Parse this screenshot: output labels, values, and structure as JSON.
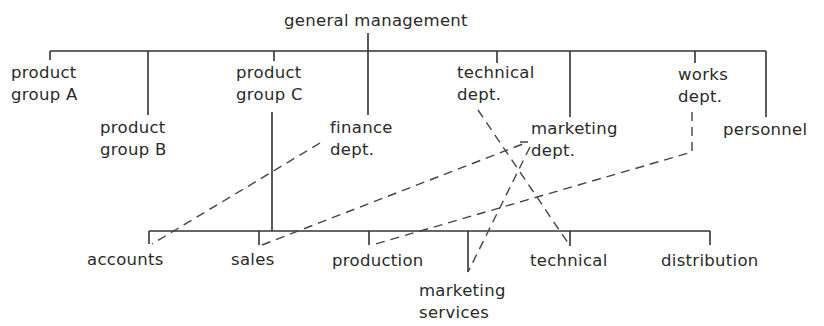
{
  "diagram": {
    "type": "organization-chart",
    "root": {
      "label": "general management"
    },
    "top_level_units": [
      {
        "id": "pgA",
        "lines": [
          "product",
          "group A"
        ]
      },
      {
        "id": "pgB",
        "lines": [
          "product",
          "group B"
        ]
      },
      {
        "id": "pgC",
        "lines": [
          "product",
          "group C"
        ]
      },
      {
        "id": "fin",
        "lines": [
          "finance",
          "dept."
        ]
      },
      {
        "id": "tech",
        "lines": [
          "technical",
          "dept."
        ]
      },
      {
        "id": "mkt",
        "lines": [
          "marketing",
          "dept."
        ]
      },
      {
        "id": "works",
        "lines": [
          "works",
          "dept."
        ]
      },
      {
        "id": "pers",
        "lines": [
          "personnel"
        ]
      }
    ],
    "sub_units_of_product_group_C": [
      {
        "id": "acc",
        "lines": [
          "accounts"
        ]
      },
      {
        "id": "sales",
        "lines": [
          "sales"
        ]
      },
      {
        "id": "prod",
        "lines": [
          "production"
        ]
      },
      {
        "id": "mserv",
        "lines": [
          "marketing",
          "services"
        ]
      },
      {
        "id": "techsub",
        "lines": [
          "technical"
        ]
      },
      {
        "id": "dist",
        "lines": [
          "distribution"
        ]
      }
    ],
    "solid_links": [
      {
        "from": "general management",
        "to": "all top-level units"
      },
      {
        "from": "product group C",
        "to": "all sub-units"
      }
    ],
    "dashed_links": [
      {
        "from": "finance dept.",
        "to": "accounts"
      },
      {
        "from": "marketing dept.",
        "to": "sales"
      },
      {
        "from": "marketing dept.",
        "to": "marketing services"
      },
      {
        "from": "technical dept.",
        "to": "technical"
      },
      {
        "from": "works dept.",
        "to": "production"
      }
    ]
  }
}
